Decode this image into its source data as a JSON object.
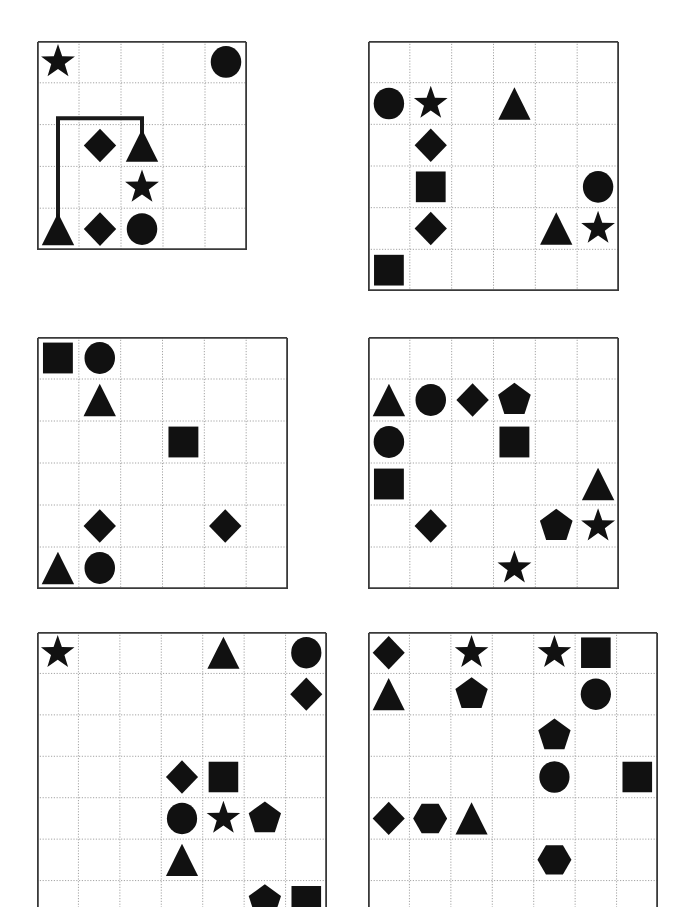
{
  "page": {
    "background_color": "#ffffff",
    "shape_color": "#111111",
    "grid_border_color": "#3a3a3a",
    "grid_line_color": "#9a9a9a",
    "path_color": "#1a1a1a",
    "width": 682,
    "height": 907
  },
  "panels": [
    {
      "name": "panel-1",
      "x": 37,
      "y": 41,
      "w": 210,
      "h": 209,
      "cols": 5,
      "rows": 5,
      "clipped_bottom": false,
      "shapes": [
        {
          "shape": "star",
          "col": 0,
          "row": 0
        },
        {
          "shape": "circle",
          "col": 4,
          "row": 0
        },
        {
          "shape": "diamond",
          "col": 1,
          "row": 2
        },
        {
          "shape": "triangle",
          "col": 2,
          "row": 2
        },
        {
          "shape": "star",
          "col": 2,
          "row": 3
        },
        {
          "shape": "triangle",
          "col": 0,
          "row": 4
        },
        {
          "shape": "diamond",
          "col": 1,
          "row": 4
        },
        {
          "shape": "circle",
          "col": 2,
          "row": 4
        }
      ],
      "path": {
        "name": "connector-path",
        "points": [
          [
            0,
            4
          ],
          [
            0,
            1.35
          ],
          [
            2,
            1.35
          ],
          [
            2,
            2
          ]
        ],
        "stroke_width": 4
      }
    },
    {
      "name": "panel-2",
      "x": 368,
      "y": 41,
      "w": 251,
      "h": 250,
      "cols": 6,
      "rows": 6,
      "clipped_bottom": false,
      "shapes": [
        {
          "shape": "circle",
          "col": 0,
          "row": 1
        },
        {
          "shape": "star",
          "col": 1,
          "row": 1
        },
        {
          "shape": "triangle",
          "col": 3,
          "row": 1
        },
        {
          "shape": "diamond",
          "col": 1,
          "row": 2
        },
        {
          "shape": "square",
          "col": 1,
          "row": 3
        },
        {
          "shape": "circle",
          "col": 5,
          "row": 3
        },
        {
          "shape": "diamond",
          "col": 1,
          "row": 4
        },
        {
          "shape": "triangle",
          "col": 4,
          "row": 4
        },
        {
          "shape": "star",
          "col": 5,
          "row": 4
        },
        {
          "shape": "square",
          "col": 0,
          "row": 5
        }
      ],
      "path": null
    },
    {
      "name": "panel-3",
      "x": 37,
      "y": 337,
      "w": 251,
      "h": 252,
      "cols": 6,
      "rows": 6,
      "clipped_bottom": false,
      "shapes": [
        {
          "shape": "square",
          "col": 0,
          "row": 0
        },
        {
          "shape": "circle",
          "col": 1,
          "row": 0
        },
        {
          "shape": "triangle",
          "col": 1,
          "row": 1
        },
        {
          "shape": "square",
          "col": 3,
          "row": 2
        },
        {
          "shape": "diamond",
          "col": 1,
          "row": 4
        },
        {
          "shape": "diamond",
          "col": 4,
          "row": 4
        },
        {
          "shape": "triangle",
          "col": 0,
          "row": 5
        },
        {
          "shape": "circle",
          "col": 1,
          "row": 5
        }
      ],
      "path": null
    },
    {
      "name": "panel-4",
      "x": 368,
      "y": 337,
      "w": 251,
      "h": 252,
      "cols": 6,
      "rows": 6,
      "clipped_bottom": false,
      "shapes": [
        {
          "shape": "triangle",
          "col": 0,
          "row": 1
        },
        {
          "shape": "circle",
          "col": 1,
          "row": 1
        },
        {
          "shape": "diamond",
          "col": 2,
          "row": 1
        },
        {
          "shape": "pentagon",
          "col": 3,
          "row": 1
        },
        {
          "shape": "circle",
          "col": 0,
          "row": 2
        },
        {
          "shape": "square",
          "col": 3,
          "row": 2
        },
        {
          "shape": "square",
          "col": 0,
          "row": 3
        },
        {
          "shape": "triangle",
          "col": 5,
          "row": 3
        },
        {
          "shape": "diamond",
          "col": 1,
          "row": 4
        },
        {
          "shape": "pentagon",
          "col": 4,
          "row": 4
        },
        {
          "shape": "star",
          "col": 5,
          "row": 4
        },
        {
          "shape": "star",
          "col": 3,
          "row": 5
        }
      ],
      "path": null
    },
    {
      "name": "panel-5",
      "x": 37,
      "y": 632,
      "w": 290,
      "h": 290,
      "cols": 7,
      "rows": 7,
      "clipped_bottom": true,
      "clip_height": 275,
      "shapes": [
        {
          "shape": "star",
          "col": 0,
          "row": 0
        },
        {
          "shape": "triangle",
          "col": 4,
          "row": 0
        },
        {
          "shape": "circle",
          "col": 6,
          "row": 0
        },
        {
          "shape": "diamond",
          "col": 6,
          "row": 1
        },
        {
          "shape": "diamond",
          "col": 3,
          "row": 3
        },
        {
          "shape": "square",
          "col": 4,
          "row": 3
        },
        {
          "shape": "circle",
          "col": 3,
          "row": 4
        },
        {
          "shape": "star",
          "col": 4,
          "row": 4
        },
        {
          "shape": "pentagon",
          "col": 5,
          "row": 4
        },
        {
          "shape": "triangle",
          "col": 3,
          "row": 5
        },
        {
          "shape": "pentagon",
          "col": 5,
          "row": 6
        },
        {
          "shape": "square",
          "col": 6,
          "row": 6
        }
      ],
      "path": null
    },
    {
      "name": "panel-6",
      "x": 368,
      "y": 632,
      "w": 290,
      "h": 290,
      "cols": 7,
      "rows": 7,
      "clipped_bottom": true,
      "clip_height": 275,
      "shapes": [
        {
          "shape": "diamond",
          "col": 0,
          "row": 0
        },
        {
          "shape": "star",
          "col": 2,
          "row": 0
        },
        {
          "shape": "star",
          "col": 4,
          "row": 0
        },
        {
          "shape": "square",
          "col": 5,
          "row": 0
        },
        {
          "shape": "triangle",
          "col": 0,
          "row": 1
        },
        {
          "shape": "pentagon",
          "col": 2,
          "row": 1
        },
        {
          "shape": "circle",
          "col": 5,
          "row": 1
        },
        {
          "shape": "pentagon",
          "col": 4,
          "row": 2
        },
        {
          "shape": "circle",
          "col": 4,
          "row": 3
        },
        {
          "shape": "square",
          "col": 6,
          "row": 3
        },
        {
          "shape": "diamond",
          "col": 0,
          "row": 4
        },
        {
          "shape": "hexagon",
          "col": 1,
          "row": 4
        },
        {
          "shape": "triangle",
          "col": 2,
          "row": 4
        },
        {
          "shape": "hexagon",
          "col": 4,
          "row": 5
        }
      ],
      "path": null
    }
  ]
}
